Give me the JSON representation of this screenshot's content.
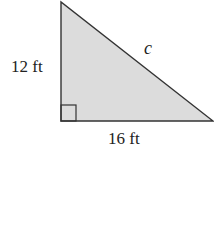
{
  "diagram": {
    "type": "right-triangle",
    "fill_color": "#dcdcdc",
    "stroke_color": "#333333",
    "labels": {
      "vertical_leg": "12 ft",
      "horizontal_leg": "16 ft",
      "hypotenuse": "c"
    },
    "right_angle_marker": true
  }
}
